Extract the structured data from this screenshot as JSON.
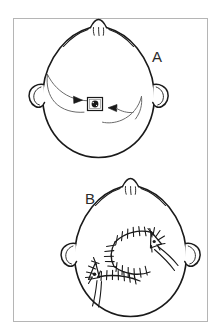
{
  "figure": {
    "type": "line-drawing",
    "view": "vertex / top-down view of head",
    "background_color": "#ffffff",
    "ink_color": "#1a1a1a",
    "frame_color": "#b5b5b5",
    "running_head": {
      "text": "",
      "legible": false,
      "color": "#d6d6d8",
      "note": "cut-off running head at top right edge"
    },
    "panels": [
      {
        "id": "A",
        "label": "A",
        "label_position": {
          "x": 152,
          "y": 62
        },
        "caption": "Lesion on scalp with planned flap advancement directions",
        "elements": [
          {
            "name": "head-outline",
            "description": "top-down head contour"
          },
          {
            "name": "nose-and-brow",
            "description": "nose tip and brow ridges at top"
          },
          {
            "name": "left-ear",
            "description": "ear seen from above, left side"
          },
          {
            "name": "right-ear",
            "description": "ear seen from above, right side"
          },
          {
            "name": "lesion",
            "description": "small dark square excision site",
            "fill": "#1a1a1a"
          },
          {
            "name": "flap-arrow-left",
            "description": "curved arrow sweeping toward lesion from upper left"
          },
          {
            "name": "flap-arrow-right",
            "description": "curved arrow sweeping toward lesion from lower right"
          }
        ]
      },
      {
        "id": "B",
        "label": "B",
        "label_position": {
          "x": 85,
          "y": 204
        },
        "caption": "Postoperative appearance with sutured flap closure",
        "elements": [
          {
            "name": "head-outline",
            "description": "top-down head contour"
          },
          {
            "name": "nose-and-brow",
            "description": "nose tip and brow ridges at top"
          },
          {
            "name": "left-ear",
            "description": "ear seen from above, left side"
          },
          {
            "name": "right-ear",
            "description": "ear seen from above, right side"
          },
          {
            "name": "suture-line-upper",
            "description": "hatched suture line, upper arc of flap"
          },
          {
            "name": "suture-line-lower",
            "description": "hatched suture line, lower arc of flap"
          },
          {
            "name": "suture-line-horizontal",
            "description": "hatched suture line running toward left"
          },
          {
            "name": "suture-junction-left",
            "description": "triangular / Y-shaped suture junction, left"
          },
          {
            "name": "suture-junction-right",
            "description": "triangular / Y-shaped suture junction, right"
          },
          {
            "name": "drain-lines",
            "description": "fine trailing suture tails"
          }
        ]
      }
    ]
  }
}
